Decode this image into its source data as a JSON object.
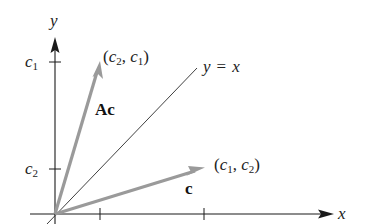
{
  "diagram": {
    "axes": {
      "x_label": "x",
      "y_label": "y",
      "x_ticks": [
        "c2",
        "c1"
      ],
      "y_ticks": [
        {
          "label": "c",
          "sub": "1"
        },
        {
          "label": "c",
          "sub": "2"
        }
      ]
    },
    "line": {
      "label_left": "y",
      "label_eq": "=",
      "label_right": "x"
    },
    "vectors": [
      {
        "name": "c",
        "label": "c",
        "point_label": {
          "open": "(",
          "a": "c",
          "a_sub": "1",
          "sep": ", ",
          "b": "c",
          "b_sub": "2",
          "close": ")"
        },
        "color": "#9a9a9a"
      },
      {
        "name": "Ac",
        "label": "Ac",
        "point_label": {
          "open": "(",
          "a": "c",
          "a_sub": "2",
          "sep": ", ",
          "b": "c",
          "b_sub": "1",
          "close": ")"
        },
        "color": "#9a9a9a"
      }
    ]
  }
}
